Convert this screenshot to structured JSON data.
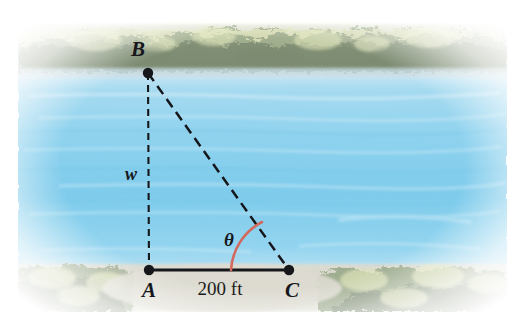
{
  "figure": {
    "name": "river-width-trigonometry-figure",
    "vertices": [
      {
        "id": "B",
        "label": "B",
        "x": 148,
        "y": 73,
        "label_x": 138,
        "label_y": 56,
        "shore": "far"
      },
      {
        "id": "A",
        "label": "A",
        "x": 149,
        "y": 270,
        "label_x": 142,
        "label_y": 296,
        "shore": "near"
      },
      {
        "id": "C",
        "label": "C",
        "x": 289,
        "y": 270,
        "label_x": 288,
        "label_y": 296,
        "shore": "near"
      }
    ],
    "edges": [
      {
        "id": "BA",
        "from": "B",
        "to": "A",
        "style": "dashed",
        "label": "w",
        "label_x": 131,
        "label_y": 180
      },
      {
        "id": "BC",
        "from": "B",
        "to": "C",
        "style": "dashed",
        "label": "",
        "label_x": 0,
        "label_y": 0
      },
      {
        "id": "AC",
        "from": "A",
        "to": "C",
        "style": "solid",
        "label": "200 ft",
        "label_x": 220,
        "label_y": 293
      }
    ],
    "angle": {
      "label": "θ",
      "at_vertex": "C",
      "label_x": 229,
      "label_y": 245,
      "arc_color": "#d2695f"
    },
    "labels": {
      "width_label": "w",
      "baseline_label": "200 ft",
      "angle_label": "θ",
      "vertex_b": "B",
      "vertex_a": "A",
      "vertex_c": "C"
    },
    "colors": {
      "water_light": "#bfe4f3",
      "water_mid": "#8fd3ee",
      "water_deep": "#6ec6e8",
      "shore_ground": "#d8d6ce",
      "foliage_light": "#d6dcae",
      "foliage_dark": "#7e8a72",
      "line": "#16171b",
      "arc": "#d2695f",
      "page": "#ffffff"
    },
    "scene": {
      "far_shore": "wooded treeline across the top",
      "water_band": "river surface spanning the middle",
      "near_shore": "grassy bank along the bottom"
    }
  }
}
